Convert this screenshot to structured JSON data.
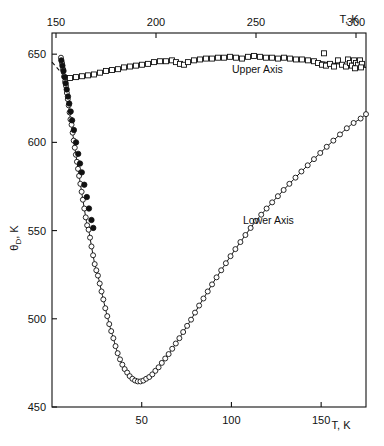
{
  "figure": {
    "background": "#ffffff",
    "ink": "#111111",
    "frame": {
      "x": 52,
      "y": 33,
      "width": 314,
      "height": 374
    }
  },
  "axes": {
    "y": {
      "title_main": "θ",
      "title_sub": "D",
      "title_tail": ", K",
      "min": 450,
      "max": 662,
      "ticks": [
        450,
        500,
        550,
        600,
        650
      ],
      "tick_labels": [
        "450",
        "500",
        "550",
        "600",
        "650"
      ],
      "side": "left"
    },
    "x_lower": {
      "title": "T, K",
      "min": 0,
      "max": 175,
      "ticks": [
        50,
        100,
        150
      ],
      "tick_labels": [
        "50",
        "100",
        "150"
      ],
      "side": "bottom"
    },
    "x_upper": {
      "title": "T, K",
      "min": 148,
      "max": 305,
      "ticks": [
        150,
        200,
        250,
        300
      ],
      "tick_labels": [
        "150",
        "200",
        "250",
        "300"
      ],
      "side": "top"
    }
  },
  "annotations": [
    {
      "name": "upper-axis-label",
      "text": "Upper Axis",
      "x_px": 232,
      "y_px": 73
    },
    {
      "name": "lower-axis-label",
      "text": "Lower Axis",
      "x_px": 243,
      "y_px": 224
    }
  ],
  "chart_data": {
    "type": "scatter",
    "title": "",
    "xlabel": "T, K",
    "ylabel": "θ_D, K",
    "xlim_lower": [
      0,
      175
    ],
    "xlim_upper": [
      148,
      305
    ],
    "ylim": [
      450,
      662
    ],
    "grid": false,
    "legend": "none",
    "x_axis_count": 2,
    "series": [
      {
        "name": "Lower Axis",
        "marker": "open-circle",
        "axis": "x_lower",
        "line": true,
        "points": [
          [
            5.0,
            648.0
          ],
          [
            5.6,
            645.0
          ],
          [
            6.2,
            641.5
          ],
          [
            6.8,
            637.5
          ],
          [
            7.3,
            634.5
          ],
          [
            7.8,
            632.0
          ],
          [
            8.3,
            628.0
          ],
          [
            8.8,
            624.5
          ],
          [
            9.3,
            621.0
          ],
          [
            9.8,
            617.0
          ],
          [
            10.3,
            613.0
          ],
          [
            10.9,
            610.0
          ],
          [
            11.5,
            605.5
          ],
          [
            12.1,
            601.0
          ],
          [
            12.7,
            597.0
          ],
          [
            13.3,
            593.0
          ],
          [
            13.9,
            589.0
          ],
          [
            14.5,
            585.0
          ],
          [
            15.1,
            581.0
          ],
          [
            15.8,
            576.5
          ],
          [
            16.5,
            572.0
          ],
          [
            17.2,
            567.5
          ],
          [
            18.0,
            562.5
          ],
          [
            18.8,
            557.5
          ],
          [
            19.6,
            553.0
          ],
          [
            20.4,
            550.5
          ],
          [
            21.2,
            546.0
          ],
          [
            22.0,
            541.0
          ],
          [
            22.9,
            536.0
          ],
          [
            23.8,
            531.0
          ],
          [
            24.7,
            527.5
          ],
          [
            25.6,
            524.5
          ],
          [
            26.6,
            520.0
          ],
          [
            27.6,
            515.5
          ],
          [
            28.6,
            511.0
          ],
          [
            29.7,
            506.0
          ],
          [
            30.8,
            501.5
          ],
          [
            31.9,
            497.0
          ],
          [
            33.0,
            493.0
          ],
          [
            34.2,
            489.0
          ],
          [
            35.4,
            484.5
          ],
          [
            36.6,
            480.5
          ],
          [
            37.9,
            477.0
          ],
          [
            39.2,
            474.0
          ],
          [
            40.5,
            471.5
          ],
          [
            41.9,
            469.5
          ],
          [
            43.3,
            467.5
          ],
          [
            44.8,
            466.0
          ],
          [
            46.3,
            465.0
          ],
          [
            47.8,
            464.5
          ],
          [
            49.3,
            464.5
          ],
          [
            50.9,
            465.0
          ],
          [
            52.5,
            466.0
          ],
          [
            54.2,
            467.0
          ],
          [
            55.9,
            468.5
          ],
          [
            57.6,
            470.5
          ],
          [
            59.4,
            472.5
          ],
          [
            61.2,
            475.0
          ],
          [
            63.1,
            477.5
          ],
          [
            65.0,
            480.0
          ],
          [
            67.0,
            483.0
          ],
          [
            69.0,
            486.0
          ],
          [
            71.0,
            489.0
          ],
          [
            73.1,
            492.5
          ],
          [
            75.3,
            496.0
          ],
          [
            77.5,
            499.5
          ],
          [
            79.7,
            503.5
          ],
          [
            82.0,
            507.5
          ],
          [
            84.4,
            511.5
          ],
          [
            86.8,
            515.5
          ],
          [
            89.2,
            519.5
          ],
          [
            91.7,
            523.5
          ],
          [
            94.3,
            527.5
          ],
          [
            96.9,
            531.5
          ],
          [
            99.5,
            535.5
          ],
          [
            102.2,
            539.5
          ],
          [
            105.0,
            543.5
          ],
          [
            107.8,
            547.5
          ],
          [
            110.7,
            551.5
          ],
          [
            113.6,
            555.5
          ],
          [
            116.6,
            559.0
          ],
          [
            119.6,
            562.5
          ],
          [
            122.7,
            566.0
          ],
          [
            125.9,
            569.5
          ],
          [
            129.1,
            573.0
          ],
          [
            132.3,
            576.5
          ],
          [
            135.7,
            580.0
          ],
          [
            139.0,
            583.5
          ],
          [
            142.5,
            587.0
          ],
          [
            146.0,
            590.5
          ],
          [
            149.5,
            594.0
          ],
          [
            153.1,
            597.5
          ],
          [
            156.8,
            601.0
          ],
          [
            160.5,
            604.5
          ],
          [
            164.3,
            608.0
          ],
          [
            168.1,
            611.0
          ],
          [
            172.0,
            613.5
          ],
          [
            175.0,
            616.0
          ]
        ]
      },
      {
        "name": "Lower Axis filled subset",
        "marker": "filled-circle",
        "axis": "x_lower",
        "line": false,
        "points": [
          [
            5.2,
            646.5
          ],
          [
            5.8,
            643.5
          ],
          [
            6.4,
            640.5
          ],
          [
            7.0,
            637.0
          ],
          [
            7.6,
            633.5
          ],
          [
            8.2,
            630.0
          ],
          [
            8.9,
            626.0
          ],
          [
            9.6,
            622.0
          ],
          [
            10.4,
            617.5
          ],
          [
            11.2,
            612.5
          ],
          [
            12.2,
            607.0
          ],
          [
            13.4,
            600.0
          ],
          [
            14.6,
            593.5
          ],
          [
            15.6,
            588.0
          ],
          [
            16.6,
            583.0
          ],
          [
            18.0,
            576.0
          ],
          [
            19.4,
            569.0
          ],
          [
            20.6,
            562.5
          ],
          [
            22.0,
            556.0
          ],
          [
            23.0,
            551.5
          ]
        ]
      },
      {
        "name": "Upper Axis",
        "marker": "open-square",
        "axis": "x_upper",
        "line": false,
        "points": [
          [
            157.0,
            636.5
          ],
          [
            160.0,
            637.0
          ],
          [
            163.0,
            637.5
          ],
          [
            166.0,
            638.0
          ],
          [
            169.0,
            638.5
          ],
          [
            172.0,
            639.5
          ],
          [
            175.0,
            640.5
          ],
          [
            178.0,
            641.0
          ],
          [
            181.0,
            641.5
          ],
          [
            184.0,
            642.5
          ],
          [
            187.0,
            643.0
          ],
          [
            190.0,
            643.5
          ],
          [
            193.0,
            644.0
          ],
          [
            196.0,
            644.5
          ],
          [
            199.0,
            645.5
          ],
          [
            202.0,
            646.0
          ],
          [
            205.0,
            646.0
          ],
          [
            208.0,
            646.5
          ],
          [
            210.0,
            645.5
          ],
          [
            212.0,
            644.5
          ],
          [
            214.0,
            644.0
          ],
          [
            216.0,
            645.5
          ],
          [
            219.0,
            646.5
          ],
          [
            222.0,
            647.0
          ],
          [
            225.0,
            647.5
          ],
          [
            228.0,
            647.5
          ],
          [
            231.0,
            648.0
          ],
          [
            234.0,
            648.0
          ],
          [
            237.0,
            648.5
          ],
          [
            240.0,
            648.0
          ],
          [
            243.0,
            647.5
          ],
          [
            246.0,
            648.5
          ],
          [
            249.0,
            649.0
          ],
          [
            252.0,
            648.5
          ],
          [
            255.0,
            648.0
          ],
          [
            258.0,
            648.0
          ],
          [
            261.0,
            647.5
          ],
          [
            264.0,
            648.0
          ],
          [
            267.0,
            647.5
          ],
          [
            270.0,
            647.0
          ],
          [
            273.0,
            647.0
          ],
          [
            276.0,
            646.5
          ],
          [
            279.0,
            646.0
          ],
          [
            281.0,
            645.0
          ],
          [
            283.0,
            644.0
          ],
          [
            284.0,
            650.5
          ],
          [
            285.0,
            643.5
          ],
          [
            287.0,
            644.5
          ],
          [
            289.0,
            643.0
          ],
          [
            291.0,
            646.5
          ],
          [
            293.0,
            644.0
          ],
          [
            295.0,
            643.0
          ],
          [
            296.0,
            647.0
          ],
          [
            297.0,
            645.0
          ],
          [
            298.0,
            643.5
          ],
          [
            299.0,
            646.5
          ],
          [
            300.0,
            645.0
          ],
          [
            301.0,
            644.0
          ],
          [
            302.0,
            646.5
          ],
          [
            303.0,
            644.5
          ],
          [
            299.5,
            642.0
          ],
          [
            302.5,
            642.5
          ]
        ]
      }
    ],
    "fit_lines": [
      {
        "name": "dashed-extrapolation",
        "style": "dashed",
        "axis": "x_lower",
        "from": [
          0.0,
          645.5
        ],
        "to": [
          6.5,
          638.0
        ]
      },
      {
        "name": "upper-axis-trend",
        "style": "solid",
        "axis": "x_upper",
        "from": [
          281.0,
          646.0
        ],
        "to": [
          305.0,
          642.5
        ]
      }
    ]
  }
}
